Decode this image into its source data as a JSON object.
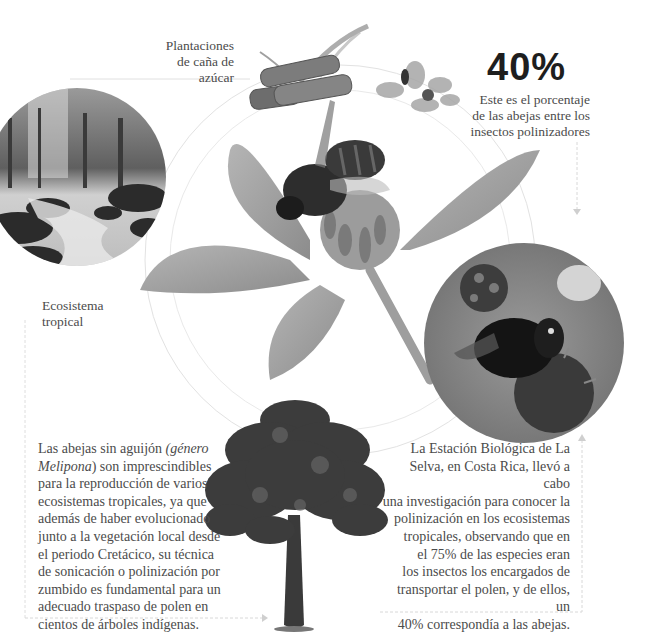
{
  "page": {
    "top_strip_text": ""
  },
  "labels": {
    "sugarcane": [
      "Plantaciones",
      "de caña de",
      "azúcar"
    ],
    "ecosystem": [
      "Ecosistema",
      "tropical"
    ]
  },
  "stat": {
    "value": "40%",
    "description": [
      "Este es el porcentaje",
      "de las abejas entre los",
      "insectos polinizadores"
    ]
  },
  "left_text": {
    "lines": [
      {
        "parts": [
          {
            "t": "Las abejas sin aguijón ",
            "i": false
          },
          {
            "t": "(género",
            "i": true
          }
        ]
      },
      {
        "parts": [
          {
            "t": "Melipona",
            "i": true
          },
          {
            "t": ") son imprescindibles",
            "i": false
          }
        ]
      },
      {
        "parts": [
          {
            "t": "para la reproducción de varios",
            "i": false
          }
        ]
      },
      {
        "parts": [
          {
            "t": "ecosistemas tropicales, ya que",
            "i": false
          }
        ]
      },
      {
        "parts": [
          {
            "t": "además de haber evolucionado",
            "i": false
          }
        ]
      },
      {
        "parts": [
          {
            "t": "junto a la vegetación local desde",
            "i": false
          }
        ]
      },
      {
        "parts": [
          {
            "t": "el periodo Cretácico, su técnica",
            "i": false
          }
        ]
      },
      {
        "parts": [
          {
            "t": "de sonicación o polinización por",
            "i": false
          }
        ]
      },
      {
        "parts": [
          {
            "t": "zumbido es fundamental para un",
            "i": false
          }
        ]
      },
      {
        "parts": [
          {
            "t": "adecuado traspaso de polen en",
            "i": false
          }
        ]
      },
      {
        "parts": [
          {
            "t": "cientos de árboles indígenas.",
            "i": false
          }
        ]
      }
    ]
  },
  "right_text": {
    "lines": [
      "La Estación Biológica de La",
      "Selva, en Costa Rica, llevó a cabo",
      "una investigación para conocer la",
      "polinización en los ecosistemas",
      "tropicales, observando que en",
      "el 75% de las especies eran",
      "los insectos los encargados de",
      "transportar el polen, y de ellos, un",
      "40% correspondía a las abejas."
    ]
  },
  "images": {
    "forest_stream": "forest-stream-photo",
    "sugarcane": "sugarcane-illustration",
    "small_flower_bee": "small-flower-with-insect",
    "central_flower_bee": "bee-on-clover-flower",
    "bumblebee_circle": "bumblebee-on-flower-photo",
    "tree": "tropical-tree"
  },
  "colors": {
    "background": "#ffffff",
    "text": "#4b4b4b",
    "stat": "#1e1e1e",
    "guide_lines": "#d6d6d6"
  }
}
